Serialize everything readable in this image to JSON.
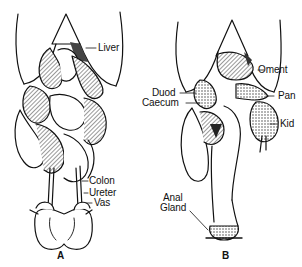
{
  "figure": {
    "panels": [
      {
        "id": "A",
        "letter": "A",
        "labels": {
          "liver": "Liver",
          "colon": "Colon",
          "ureter": "Ureter",
          "vas": "Vas"
        }
      },
      {
        "id": "B",
        "letter": "B",
        "labels": {
          "oment": "Oment",
          "duod": "Duod",
          "caecum": "Caecum",
          "pan": "Pan",
          "kid": "Kid",
          "anal_gland_line1": "Anal",
          "anal_gland_line2": "Gland"
        }
      }
    ],
    "colors": {
      "ink": "#111111",
      "paper": "#ffffff",
      "shade": "#555555"
    }
  }
}
